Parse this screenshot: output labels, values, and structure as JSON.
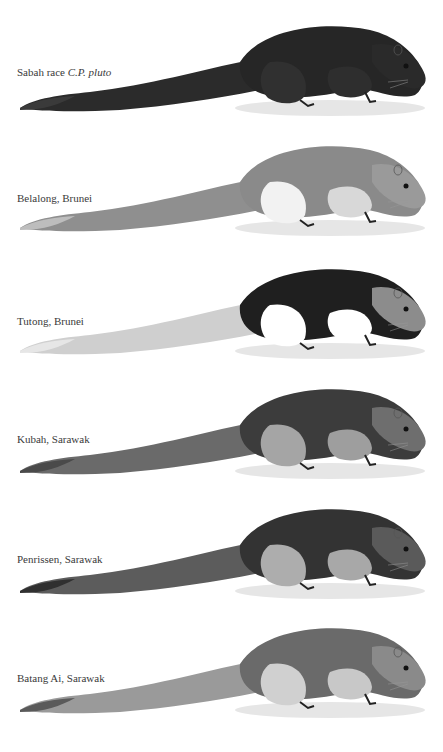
{
  "plate": {
    "panels": [
      {
        "label": "Sabah race ",
        "label_italic": "C.P. pluto",
        "top": 0,
        "label_y": 66,
        "body": "#262626",
        "belly": "#2e2e2e",
        "head": "#2a2a2a",
        "tail": "#2b2b2b",
        "tail_tip": "#3a3a3a",
        "thigh": "#303030"
      },
      {
        "label": "Belalong, Brunei",
        "label_italic": "",
        "top": 120,
        "label_y": 72,
        "body": "#8a8a8a",
        "belly": "#d8d8d8",
        "head": "#9a9a9a",
        "tail": "#8f8f8f",
        "tail_tip": "#bdbdbd",
        "thigh": "#f2f2f2"
      },
      {
        "label": "Tutong, Brunei",
        "label_italic": "",
        "top": 243,
        "label_y": 72,
        "body": "#1f1f1f",
        "belly": "#ffffff",
        "head": "#8c8c8c",
        "tail": "#cfcfcf",
        "tail_tip": "#e6e6e6",
        "thigh": "#ffffff"
      },
      {
        "label": "Kubah, Sarawak",
        "label_italic": "",
        "top": 363,
        "label_y": 70,
        "body": "#3c3c3c",
        "belly": "#9e9e9e",
        "head": "#6e6e6e",
        "tail": "#6a6a6a",
        "tail_tip": "#4a4a4a",
        "thigh": "#a5a5a5"
      },
      {
        "label": "Penrissen, Sarawak",
        "label_italic": "",
        "top": 483,
        "label_y": 70,
        "body": "#333333",
        "belly": "#a8a8a8",
        "head": "#5a5a5a",
        "tail": "#5c5c5c",
        "tail_tip": "#303030",
        "thigh": "#adadad"
      },
      {
        "label": "Batang Ai, Sarawak",
        "label_italic": "",
        "top": 602,
        "label_y": 70,
        "body": "#6a6a6a",
        "belly": "#c8c8c8",
        "head": "#8a8a8a",
        "tail": "#9a9a9a",
        "tail_tip": "#5a5a5a",
        "thigh": "#d0d0d0"
      }
    ]
  }
}
